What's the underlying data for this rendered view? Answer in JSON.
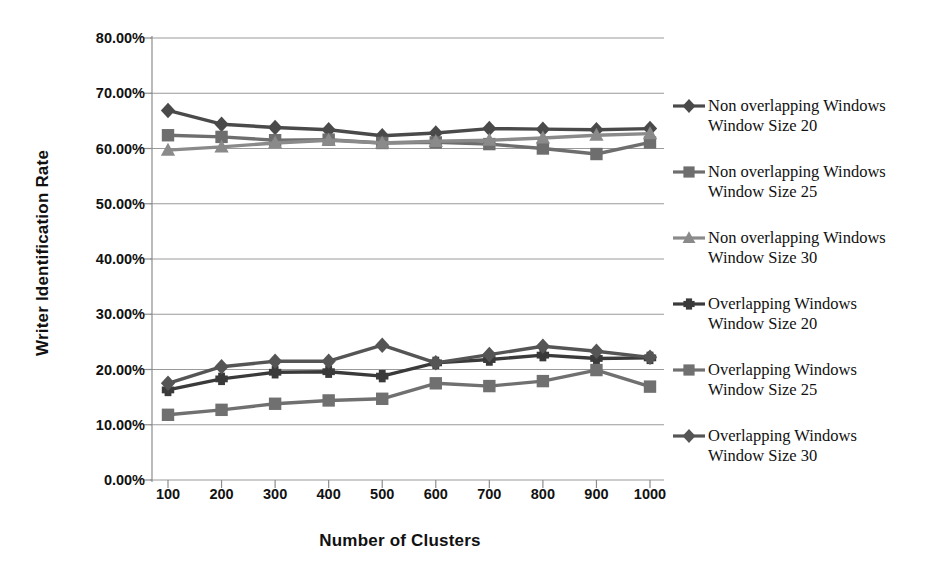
{
  "chart_data": {
    "type": "line",
    "title": "",
    "xlabel": "Number of Clusters",
    "ylabel": "Writer Identification Rate",
    "x": [
      100,
      200,
      300,
      400,
      500,
      600,
      700,
      800,
      900,
      1000
    ],
    "xticklabels": [
      "100",
      "200",
      "300",
      "400",
      "500",
      "600",
      "700",
      "800",
      "900",
      "1000"
    ],
    "yticklabels": [
      "0.00%",
      "10.00%",
      "20.00%",
      "30.00%",
      "40.00%",
      "50.00%",
      "60.00%",
      "70.00%",
      "80.00%"
    ],
    "ytickvalues": [
      0,
      10,
      20,
      30,
      40,
      50,
      60,
      70,
      80
    ],
    "ylim": [
      0,
      80
    ],
    "xlim": [
      100,
      1000
    ],
    "grid": "horizontal",
    "legend_position": "right",
    "series": [
      {
        "name": "Non overlapping Windows\nWindow Size 20",
        "marker": "diamond",
        "color": "#4a4a4a",
        "values": [
          66.9,
          64.4,
          63.8,
          63.4,
          62.3,
          62.8,
          63.6,
          63.5,
          63.4,
          63.6
        ]
      },
      {
        "name": "Non overlapping Windows\nWindow Size 25",
        "marker": "square",
        "color": "#6e6e6e",
        "values": [
          62.4,
          62.1,
          61.5,
          61.6,
          61.0,
          61.1,
          60.8,
          60.0,
          59.0,
          61.1
        ]
      },
      {
        "name": "Non overlapping Windows\nWindow Size 30",
        "marker": "triangle",
        "color": "#8a8a8a",
        "values": [
          59.7,
          60.3,
          61.0,
          61.5,
          61.0,
          61.3,
          61.5,
          61.9,
          62.4,
          62.7
        ]
      },
      {
        "name": "Overlapping Windows\nWindow Size 20",
        "marker": "cross",
        "color": "#3a3a3a",
        "values": [
          16.3,
          18.3,
          19.5,
          19.6,
          18.8,
          21.2,
          21.8,
          22.6,
          22.0,
          22.1
        ]
      },
      {
        "name": "Overlapping Windows\nWindow Size 25",
        "marker": "square",
        "color": "#707070",
        "values": [
          11.8,
          12.7,
          13.8,
          14.4,
          14.7,
          17.5,
          17.0,
          17.9,
          19.9,
          16.9
        ]
      },
      {
        "name": "Overlapping Windows\nWindow Size 30",
        "marker": "diamond",
        "color": "#555555",
        "values": [
          17.5,
          20.5,
          21.5,
          21.5,
          24.4,
          21.2,
          22.7,
          24.2,
          23.3,
          22.2
        ]
      }
    ]
  },
  "axes": {
    "y_title": "Writer Identification Rate",
    "x_title": "Number of Clusters"
  }
}
